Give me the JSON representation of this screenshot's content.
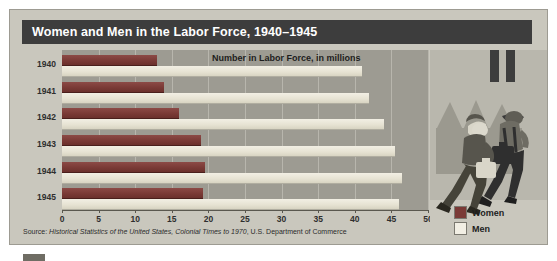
{
  "figure": {
    "title": "Women and Men in the Labor Force, 1940–1945",
    "annotation": "Number in Labor Force, in millions",
    "source_prefix": "Source: ",
    "source_italic": "Historical Statistics of the United States, Colonial Times to 1970",
    "source_suffix": ", U.S. Department of Commerce"
  },
  "legend": {
    "position": "bottom-right",
    "entries": [
      {
        "label": "Women",
        "color": "#7a3a36"
      },
      {
        "label": "Men",
        "color": "#f2efe4"
      }
    ]
  },
  "illustration": {
    "name": "woman-and-man-walking-to-factory",
    "description": "A woman in a headscarf and a man in a hat with overalls carrying lunch pails, walking past a factory with smokestacks"
  },
  "colors": {
    "title_bar": "#3d3d3d",
    "panel_background": "#c9c7bd",
    "plot_background": "#9d9b92",
    "women_bar": "#7a3a36",
    "men_bar": "#f2efe4",
    "gridline": "#b8b6ad",
    "axis": "#5a584f"
  },
  "chart_data": {
    "type": "bar",
    "orientation": "horizontal",
    "title": "Women and Men in the Labor Force, 1940–1945",
    "xlabel": "Number in Labor Force, in millions",
    "ylabel": "",
    "categories": [
      "1940",
      "1941",
      "1942",
      "1943",
      "1944",
      "1945"
    ],
    "series": [
      {
        "name": "Women",
        "color": "#7a3a36",
        "values": [
          13.0,
          14.0,
          16.0,
          19.0,
          19.5,
          19.3
        ]
      },
      {
        "name": "Men",
        "color": "#f2efe4",
        "values": [
          41.0,
          42.0,
          44.0,
          45.5,
          46.5,
          46.0
        ]
      }
    ],
    "xlim": [
      0,
      50
    ],
    "xticks": [
      0,
      5,
      10,
      15,
      20,
      25,
      30,
      35,
      40,
      45,
      50
    ],
    "grid": true,
    "legend": [
      "Women",
      "Men"
    ]
  }
}
